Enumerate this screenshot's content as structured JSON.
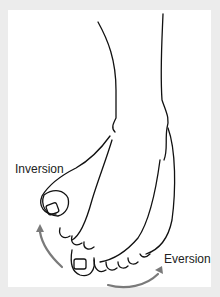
{
  "figure": {
    "labels": {
      "inversion": "Inversion",
      "eversion": "Eversion"
    },
    "colors": {
      "background": "#ececec",
      "panel": "#ffffff",
      "line": "#111111",
      "arrow": "#7a7a7a"
    }
  }
}
